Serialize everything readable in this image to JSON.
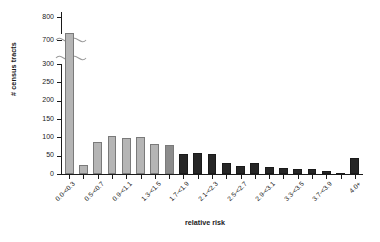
{
  "chart_data": {
    "type": "bar",
    "title": "",
    "subtitle": "",
    "xlabel": "relative risk",
    "ylabel": "# census tracts",
    "grid": false,
    "legend": null,
    "axis_break": {
      "from": 300,
      "to": 700,
      "note": "y-axis broken between 300 and 700"
    },
    "ylim": [
      0,
      800
    ],
    "ytick_labels": [
      "800",
      "700",
      "300",
      "250",
      "200",
      "150",
      "100",
      "50",
      "0"
    ],
    "ytick_values": [
      800,
      700,
      300,
      250,
      200,
      150,
      100,
      50,
      0
    ],
    "xtick_labels": [
      "0.0-<0.3",
      "0.5-<0.7",
      "0.9-<1.1",
      "1.3-<1.5",
      "1.7-<1.9",
      "2.1-<2.3",
      "2.5-<2.7",
      "2.9-<3.1",
      "3.3-<3.5",
      "3.7-<3.9",
      "4.0+"
    ],
    "categories": [
      "0.0-<0.3",
      "0.3-<0.5",
      "0.5-<0.7",
      "0.7-<0.9",
      "0.9-<1.1",
      "1.1-<1.3",
      "1.3-<1.5",
      "1.5-<1.7",
      "1.7-<1.9",
      "1.9-<2.1",
      "2.1-<2.3",
      "2.3-<2.5",
      "2.5-<2.7",
      "2.7-<2.9",
      "2.9-<3.1",
      "3.1-<3.3",
      "3.3-<3.5",
      "3.5-<3.7",
      "3.7-<3.9",
      "3.9-<4.0",
      "4.0+"
    ],
    "values": [
      730,
      25,
      88,
      105,
      99,
      102,
      82,
      78,
      55,
      57,
      55,
      30,
      22,
      31,
      18,
      16,
      15,
      13,
      8,
      3,
      44
    ],
    "bar_colors": [
      "#b5b5b5",
      "#b5b5b5",
      "#b5b5b5",
      "#b5b5b5",
      "#b5b5b5",
      "#b5b5b5",
      "#b5b5b5",
      "#8c8c8c",
      "#262626",
      "#262626",
      "#262626",
      "#262626",
      "#262626",
      "#262626",
      "#262626",
      "#262626",
      "#262626",
      "#262626",
      "#262626",
      "#262626",
      "#262626"
    ],
    "colors": {
      "light_bar": "#b5b5b5",
      "mid_bar": "#8c8c8c",
      "dark_bar": "#262626",
      "axis": "#1a1a1a"
    }
  }
}
